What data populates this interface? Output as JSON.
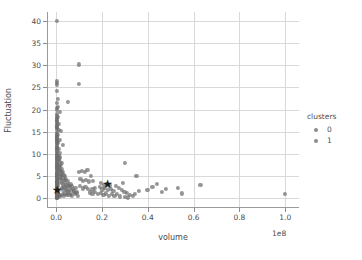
{
  "chart_data": {
    "type": "scatter",
    "title": "",
    "xlabel": "volume",
    "ylabel": "Fluctuation",
    "x_offset_text": "1e8",
    "xlim": [
      -4000000.0,
      106000000.0
    ],
    "ylim": [
      -2.2,
      42.0
    ],
    "x_ticks": [
      0.0,
      0.2,
      0.4,
      0.6,
      0.8,
      1.0
    ],
    "x_ticklabels": [
      "0.0",
      "0.2",
      "0.4",
      "0.6",
      "0.8",
      "1.0"
    ],
    "y_ticks": [
      0,
      5,
      10,
      15,
      20,
      25,
      30,
      35,
      40
    ],
    "y_ticklabels": [
      "0",
      "5",
      "10",
      "15",
      "20",
      "25",
      "30",
      "35",
      "40"
    ],
    "grid": true,
    "grid_color": "#d9d9d9",
    "legend": {
      "title": "clusters",
      "position": "right-outside",
      "entries": [
        {
          "label": "0",
          "color": "#6e6e6e"
        },
        {
          "label": "1",
          "color": "#6e6e6e"
        }
      ]
    },
    "marker_color": "#6e6e6e",
    "marker_opacity": 0.72,
    "centroid_marker": "star",
    "centroid_color": "#1d1d1d",
    "centroids": [
      {
        "x": 0.004,
        "y": 1.9,
        "cluster": "0"
      },
      {
        "x": 0.225,
        "y": 3.1,
        "cluster": "1"
      }
    ],
    "series": [
      {
        "name": "0",
        "color": "#6e6e6e",
        "points": [
          [
            0.004,
            40.0
          ],
          [
            0.004,
            26.4
          ],
          [
            0.005,
            26.0
          ],
          [
            0.004,
            25.6
          ],
          [
            0.004,
            24.2
          ],
          [
            0.008,
            22.4
          ],
          [
            0.004,
            20.3
          ],
          [
            0.004,
            19.9
          ],
          [
            0.016,
            19.4
          ],
          [
            0.004,
            18.6
          ],
          [
            0.004,
            18.2
          ],
          [
            0.005,
            17.9
          ],
          [
            0.004,
            17.4
          ],
          [
            0.004,
            17.0
          ],
          [
            0.004,
            16.6
          ],
          [
            0.004,
            16.2
          ],
          [
            0.005,
            15.8
          ],
          [
            0.004,
            15.4
          ],
          [
            0.022,
            15.1
          ],
          [
            0.004,
            14.8
          ],
          [
            0.004,
            14.4
          ],
          [
            0.005,
            14.0
          ],
          [
            0.004,
            13.7
          ],
          [
            0.004,
            13.3
          ],
          [
            0.018,
            13.2
          ],
          [
            0.004,
            12.9
          ],
          [
            0.005,
            12.5
          ],
          [
            0.004,
            12.2
          ],
          [
            0.03,
            12.0
          ],
          [
            0.004,
            11.8
          ],
          [
            0.004,
            11.4
          ],
          [
            0.005,
            11.1
          ],
          [
            0.004,
            10.8
          ],
          [
            0.004,
            10.4
          ],
          [
            0.014,
            10.2
          ],
          [
            0.004,
            10.0
          ],
          [
            0.005,
            9.7
          ],
          [
            0.004,
            9.4
          ],
          [
            0.004,
            9.1
          ],
          [
            0.01,
            9.0
          ],
          [
            0.004,
            8.7
          ],
          [
            0.005,
            8.4
          ],
          [
            0.004,
            8.1
          ],
          [
            0.026,
            8.0
          ],
          [
            0.004,
            7.8
          ],
          [
            0.004,
            7.5
          ],
          [
            0.005,
            7.2
          ],
          [
            0.004,
            6.9
          ],
          [
            0.012,
            6.8
          ],
          [
            0.004,
            6.6
          ],
          [
            0.004,
            6.3
          ],
          [
            0.02,
            6.2
          ],
          [
            0.005,
            6.0
          ],
          [
            0.004,
            5.8
          ],
          [
            0.004,
            5.5
          ],
          [
            0.008,
            5.4
          ],
          [
            0.004,
            5.2
          ],
          [
            0.005,
            5.0
          ],
          [
            0.004,
            4.8
          ],
          [
            0.016,
            4.7
          ],
          [
            0.004,
            4.5
          ],
          [
            0.004,
            4.3
          ],
          [
            0.006,
            4.2
          ],
          [
            0.005,
            4.0
          ],
          [
            0.004,
            3.8
          ],
          [
            0.004,
            3.6
          ],
          [
            0.011,
            3.5
          ],
          [
            0.004,
            3.4
          ],
          [
            0.005,
            3.2
          ],
          [
            0.004,
            3.0
          ],
          [
            0.004,
            2.8
          ],
          [
            0.009,
            2.7
          ],
          [
            0.004,
            2.6
          ],
          [
            0.005,
            2.4
          ],
          [
            0.004,
            2.2
          ],
          [
            0.004,
            2.0
          ],
          [
            0.013,
            1.9
          ],
          [
            0.004,
            1.8
          ],
          [
            0.005,
            1.6
          ],
          [
            0.004,
            1.4
          ],
          [
            0.004,
            1.2
          ],
          [
            0.007,
            1.1
          ],
          [
            0.004,
            1.0
          ],
          [
            0.005,
            0.8
          ],
          [
            0.004,
            0.6
          ],
          [
            0.004,
            0.4
          ],
          [
            0.006,
            0.3
          ],
          [
            0.004,
            0.2
          ],
          [
            0.005,
            0.1
          ],
          [
            0.004,
            0.05
          ],
          [
            0.01,
            0.4
          ],
          [
            0.016,
            0.7
          ],
          [
            0.022,
            0.5
          ],
          [
            0.028,
            0.9
          ],
          [
            0.034,
            0.6
          ],
          [
            0.04,
            1.1
          ],
          [
            0.046,
            0.8
          ],
          [
            0.052,
            1.3
          ],
          [
            0.058,
            0.7
          ],
          [
            0.064,
            1.0
          ],
          [
            0.07,
            0.5
          ],
          [
            0.076,
            1.4
          ],
          [
            0.082,
            0.9
          ],
          [
            0.088,
            1.2
          ],
          [
            0.094,
            0.6
          ],
          [
            0.024,
            2.4
          ],
          [
            0.03,
            2.0
          ],
          [
            0.036,
            2.6
          ],
          [
            0.042,
            1.8
          ],
          [
            0.048,
            2.2
          ],
          [
            0.054,
            1.6
          ],
          [
            0.06,
            2.5
          ],
          [
            0.066,
            1.9
          ],
          [
            0.072,
            2.1
          ],
          [
            0.078,
            1.7
          ],
          [
            0.084,
            2.3
          ],
          [
            0.09,
            1.5
          ],
          [
            0.026,
            3.4
          ],
          [
            0.032,
            3.0
          ],
          [
            0.038,
            3.6
          ],
          [
            0.044,
            2.9
          ],
          [
            0.05,
            3.2
          ],
          [
            0.056,
            2.7
          ],
          [
            0.062,
            3.1
          ],
          [
            0.068,
            2.8
          ],
          [
            0.02,
            4.4
          ],
          [
            0.026,
            4.0
          ],
          [
            0.032,
            4.6
          ],
          [
            0.038,
            4.1
          ],
          [
            0.044,
            4.3
          ],
          [
            0.05,
            3.9
          ],
          [
            0.014,
            5.4
          ],
          [
            0.02,
            5.1
          ],
          [
            0.026,
            5.6
          ],
          [
            0.032,
            5.2
          ],
          [
            0.038,
            5.0
          ],
          [
            0.012,
            6.4
          ],
          [
            0.018,
            6.1
          ],
          [
            0.024,
            6.6
          ],
          [
            0.03,
            6.0
          ],
          [
            0.01,
            7.4
          ],
          [
            0.016,
            7.1
          ],
          [
            0.022,
            7.5
          ],
          [
            0.012,
            8.6
          ],
          [
            0.018,
            8.2
          ],
          [
            0.01,
            9.6
          ],
          [
            0.016,
            9.2
          ],
          [
            0.01,
            11.2
          ],
          [
            0.008,
            12.6
          ],
          [
            0.008,
            14.2
          ],
          [
            0.012,
            15.4
          ],
          [
            0.01,
            16.8
          ],
          [
            0.008,
            18.4
          ],
          [
            0.006,
            20.6
          ],
          [
            0.05,
            21.8
          ],
          [
            0.003,
            1.5
          ],
          [
            0.003,
            2.5
          ],
          [
            0.003,
            3.5
          ],
          [
            0.003,
            5.5
          ],
          [
            0.003,
            7.0
          ],
          [
            0.003,
            9.5
          ],
          [
            0.003,
            11.5
          ],
          [
            0.003,
            13.5
          ],
          [
            0.003,
            16.0
          ],
          [
            0.003,
            19.0
          ],
          [
            0.003,
            21.5
          ],
          [
            0.002,
            0.9
          ],
          [
            0.002,
            4.9
          ],
          [
            0.002,
            8.9
          ],
          [
            0.002,
            12.9
          ],
          [
            0.002,
            17.5
          ]
        ]
      },
      {
        "name": "1",
        "color": "#6e6e6e",
        "points": [
          [
            0.1,
            30.2
          ],
          [
            0.1,
            25.8
          ],
          [
            0.1,
            5.9
          ],
          [
            0.112,
            6.2
          ],
          [
            0.124,
            6.0
          ],
          [
            0.136,
            6.4
          ],
          [
            0.106,
            4.4
          ],
          [
            0.118,
            4.0
          ],
          [
            0.13,
            4.2
          ],
          [
            0.142,
            3.8
          ],
          [
            0.15,
            5.1
          ],
          [
            0.162,
            4.0
          ],
          [
            0.158,
            2.0
          ],
          [
            0.17,
            2.4
          ],
          [
            0.104,
            2.8
          ],
          [
            0.116,
            2.2
          ],
          [
            0.128,
            2.5
          ],
          [
            0.14,
            2.1
          ],
          [
            0.146,
            1.3
          ],
          [
            0.158,
            1.0
          ],
          [
            0.17,
            1.4
          ],
          [
            0.182,
            0.9
          ],
          [
            0.194,
            1.2
          ],
          [
            0.206,
            0.7
          ],
          [
            0.218,
            1.1
          ],
          [
            0.23,
            0.6
          ],
          [
            0.242,
            1.0
          ],
          [
            0.254,
            0.5
          ],
          [
            0.266,
            0.9
          ],
          [
            0.278,
            0.4
          ],
          [
            0.19,
            2.6
          ],
          [
            0.202,
            2.0
          ],
          [
            0.214,
            2.3
          ],
          [
            0.226,
            1.8
          ],
          [
            0.238,
            2.1
          ],
          [
            0.25,
            1.6
          ],
          [
            0.196,
            3.4
          ],
          [
            0.208,
            3.0
          ],
          [
            0.22,
            3.2
          ],
          [
            0.232,
            2.9
          ],
          [
            0.262,
            2.8
          ],
          [
            0.274,
            2.3
          ],
          [
            0.286,
            1.9
          ],
          [
            0.298,
            1.5
          ],
          [
            0.31,
            1.2
          ],
          [
            0.322,
            0.8
          ],
          [
            0.334,
            0.5
          ],
          [
            0.29,
            3.5
          ],
          [
            0.3,
            0.3
          ],
          [
            0.312,
            0.2
          ],
          [
            0.345,
            0.9
          ],
          [
            0.36,
            1.6
          ],
          [
            0.3,
            7.9
          ],
          [
            0.35,
            5.0
          ],
          [
            0.398,
            1.8
          ],
          [
            0.42,
            2.6
          ],
          [
            0.44,
            3.3
          ],
          [
            0.46,
            1.4
          ],
          [
            0.48,
            2.1
          ],
          [
            0.53,
            2.4
          ],
          [
            0.55,
            1.1
          ],
          [
            0.63,
            3.0
          ],
          [
            0.999,
            1.0
          ]
        ]
      }
    ]
  }
}
